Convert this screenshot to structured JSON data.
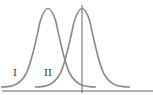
{
  "diagram": {
    "type": "two overlapping normal distribution curves",
    "curves": [
      {
        "label": "I",
        "peak_x": 48,
        "color": "#8a8a8a"
      },
      {
        "label": "II",
        "peak_x": 82,
        "color": "#8a8a8a"
      }
    ],
    "axis_color": "#555555",
    "has_vertical_line_through_peak_II": true,
    "has_baseline": true
  },
  "labels": {
    "curve_1": "I",
    "curve_2": "II"
  }
}
